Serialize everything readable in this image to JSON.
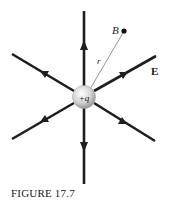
{
  "figure": {
    "caption": "FIGURE 17.7",
    "charge_label": "+q",
    "point_label": "B",
    "distance_label": "r",
    "field_label": "E"
  },
  "colors": {
    "line": "#1e1e1e",
    "charge_fill": "#d8d8d8",
    "radius_line": "#777777",
    "text": "#1a1a1a"
  },
  "field_lines": [
    {
      "direction": "up",
      "arrow": "outward"
    },
    {
      "direction": "down",
      "arrow": "outward"
    },
    {
      "direction": "upper-left",
      "arrow": "outward"
    },
    {
      "direction": "upper-right",
      "arrow": "outward"
    },
    {
      "direction": "lower-left",
      "arrow": "outward"
    },
    {
      "direction": "lower-right",
      "arrow": "outward"
    }
  ]
}
